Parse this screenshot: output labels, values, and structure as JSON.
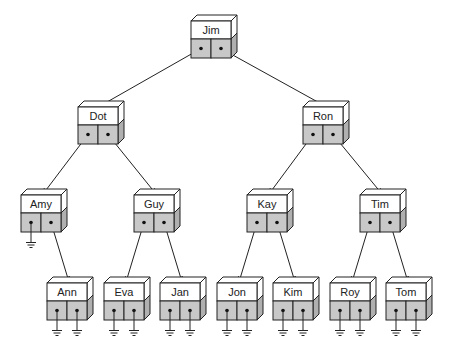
{
  "diagram": {
    "type": "binary-search-tree",
    "node_style": {
      "front_fill": "#ffffff",
      "pointer_fill": "#c8c8c8",
      "side_fill": "#b0b0b0",
      "stroke": "#222222"
    },
    "nodes": [
      {
        "id": "Jim",
        "label": "Jim",
        "x": 191,
        "y": 21,
        "left": "Dot",
        "right": "Ron"
      },
      {
        "id": "Dot",
        "label": "Dot",
        "x": 78,
        "y": 107,
        "left": "Amy",
        "right": "Guy"
      },
      {
        "id": "Ron",
        "label": "Ron",
        "x": 303,
        "y": 107,
        "left": "Kay",
        "right": "Tim"
      },
      {
        "id": "Amy",
        "label": "Amy",
        "x": 21,
        "y": 195,
        "left": null,
        "right": "Ann"
      },
      {
        "id": "Guy",
        "label": "Guy",
        "x": 134,
        "y": 195,
        "left": "Eva",
        "right": "Jan"
      },
      {
        "id": "Kay",
        "label": "Kay",
        "x": 247,
        "y": 195,
        "left": "Jon",
        "right": "Kim"
      },
      {
        "id": "Tim",
        "label": "Tim",
        "x": 360,
        "y": 195,
        "left": "Roy",
        "right": "Tom"
      },
      {
        "id": "Ann",
        "label": "Ann",
        "x": 47,
        "y": 283,
        "left": null,
        "right": null
      },
      {
        "id": "Eva",
        "label": "Eva",
        "x": 104,
        "y": 283,
        "left": null,
        "right": null
      },
      {
        "id": "Jan",
        "label": "Jan",
        "x": 160,
        "y": 283,
        "left": null,
        "right": null
      },
      {
        "id": "Jon",
        "label": "Jon",
        "x": 217,
        "y": 283,
        "left": null,
        "right": null
      },
      {
        "id": "Kim",
        "label": "Kim",
        "x": 273,
        "y": 283,
        "left": null,
        "right": null
      },
      {
        "id": "Roy",
        "label": "Roy",
        "x": 330,
        "y": 283,
        "left": null,
        "right": null
      },
      {
        "id": "Tom",
        "label": "Tom",
        "x": 386,
        "y": 283,
        "left": null,
        "right": null
      }
    ]
  }
}
